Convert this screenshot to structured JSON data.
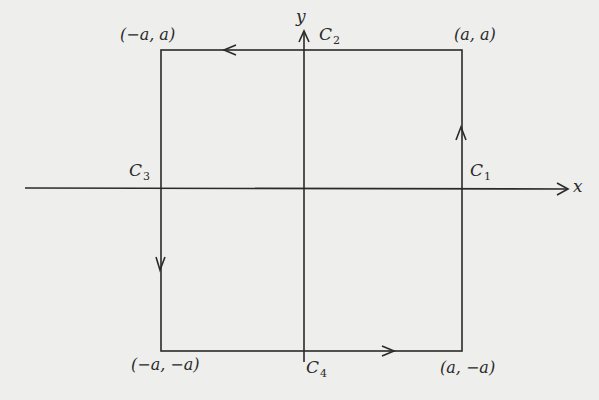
{
  "diagram": {
    "type": "contour-square",
    "colors": {
      "background": "#eeeeec",
      "stroke": "#2a2a2a"
    },
    "axes": {
      "x_label": "x",
      "y_label": "y"
    },
    "corners": {
      "top_left": "(−a, a)",
      "top_right": "(a, a)",
      "bottom_left": "(−a, −a)",
      "bottom_right": "(a, −a)"
    },
    "segments": [
      {
        "name": "C",
        "sub": "1",
        "side": "right",
        "direction": "up"
      },
      {
        "name": "C",
        "sub": "2",
        "side": "top",
        "direction": "left"
      },
      {
        "name": "C",
        "sub": "3",
        "side": "left",
        "direction": "down"
      },
      {
        "name": "C",
        "sub": "4",
        "side": "bottom",
        "direction": "right"
      }
    ]
  }
}
